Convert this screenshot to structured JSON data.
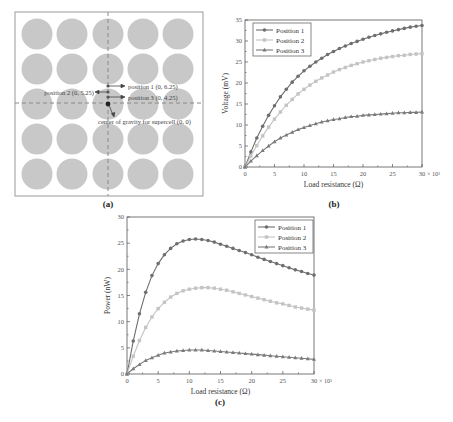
{
  "panel_a": {
    "caption": "(a)",
    "grid_rows": 5,
    "grid_cols": 5,
    "annotations": {
      "position1": "position 1 (0, 6.25)",
      "position2": "position 2 (0, 5.25)",
      "position3": "position 3 (0, 4.25)",
      "center": "center of gravity for supercell (0, 0)"
    },
    "colors": {
      "circle": "#c8c8c8",
      "dashed_line": "#888888",
      "frame": "#999999"
    }
  },
  "chart_data": [
    {
      "id": "b",
      "type": "line",
      "caption": "(b)",
      "title": "",
      "xlabel": "Load resistance (Ω)",
      "ylabel": "Voltage (mV)",
      "x_multiplier": "× 10³",
      "xlim": [
        0,
        30
      ],
      "ylim": [
        0,
        35
      ],
      "xticks": [
        0,
        5,
        10,
        15,
        20,
        25,
        30
      ],
      "yticks": [
        0,
        5,
        10,
        15,
        20,
        25,
        30,
        35
      ],
      "grid": false,
      "legend_position": "top-left",
      "x": [
        0,
        1,
        2,
        3,
        4,
        5,
        6,
        7,
        8,
        9,
        10,
        11,
        12,
        13,
        14,
        15,
        16,
        17,
        18,
        19,
        20,
        21,
        22,
        23,
        24,
        25,
        26,
        27,
        28,
        29,
        30
      ],
      "series": [
        {
          "name": "Position 1",
          "marker": "circle",
          "color": "#6e6e6e",
          "values": [
            0,
            3.6,
            6.9,
            9.7,
            12.3,
            14.6,
            16.7,
            18.5,
            20.2,
            21.6,
            22.9,
            24.0,
            25.0,
            25.9,
            26.8,
            27.5,
            28.2,
            28.8,
            29.4,
            29.9,
            30.4,
            30.9,
            31.3,
            31.7,
            32.1,
            32.4,
            32.7,
            33.0,
            33.3,
            33.5,
            33.7
          ]
        },
        {
          "name": "Position 2",
          "marker": "square",
          "color": "#c4c4c4",
          "values": [
            0,
            2.6,
            5.1,
            7.4,
            9.5,
            11.4,
            13.1,
            14.7,
            16.1,
            17.4,
            18.5,
            19.5,
            20.4,
            21.2,
            21.9,
            22.6,
            23.2,
            23.7,
            24.2,
            24.6,
            25.0,
            25.3,
            25.6,
            25.9,
            26.1,
            26.3,
            26.5,
            26.6,
            26.8,
            26.9,
            27.0
          ]
        },
        {
          "name": "Position 3",
          "marker": "triangle",
          "color": "#7a7a7a",
          "values": [
            0,
            1.4,
            2.7,
            3.9,
            5.0,
            6.0,
            6.9,
            7.6,
            8.3,
            8.9,
            9.4,
            9.9,
            10.3,
            10.7,
            11.0,
            11.3,
            11.5,
            11.8,
            12.0,
            12.1,
            12.3,
            12.4,
            12.5,
            12.6,
            12.7,
            12.8,
            12.9,
            12.9,
            13.0,
            13.0,
            13.1
          ]
        }
      ]
    },
    {
      "id": "c",
      "type": "line",
      "caption": "(c)",
      "title": "",
      "xlabel": "Load resistance (Ω)",
      "ylabel": "Power (nW)",
      "x_multiplier": "× 10³",
      "xlim": [
        0,
        30
      ],
      "ylim": [
        0,
        30
      ],
      "xticks": [
        0,
        5,
        10,
        15,
        20,
        25,
        30
      ],
      "yticks": [
        0,
        5,
        10,
        15,
        20,
        25,
        30
      ],
      "grid": false,
      "legend_position": "top-right",
      "x": [
        0,
        1,
        2,
        3,
        4,
        5,
        6,
        7,
        8,
        9,
        10,
        11,
        12,
        13,
        14,
        15,
        16,
        17,
        18,
        19,
        20,
        21,
        22,
        23,
        24,
        25,
        26,
        27,
        28,
        29,
        30
      ],
      "series": [
        {
          "name": "Position 1",
          "marker": "circle",
          "color": "#6e6e6e",
          "values": [
            0,
            6.3,
            11.5,
            15.6,
            18.8,
            21.1,
            22.8,
            24.0,
            24.9,
            25.4,
            25.7,
            25.8,
            25.7,
            25.5,
            25.2,
            24.8,
            24.4,
            24.0,
            23.6,
            23.2,
            22.8,
            22.3,
            21.9,
            21.5,
            21.1,
            20.7,
            20.3,
            19.9,
            19.6,
            19.2,
            18.9
          ]
        },
        {
          "name": "Position 2",
          "marker": "square",
          "color": "#c4c4c4",
          "values": [
            0,
            3.4,
            6.4,
            8.9,
            10.9,
            12.5,
            13.7,
            14.7,
            15.4,
            15.9,
            16.2,
            16.4,
            16.5,
            16.5,
            16.4,
            16.2,
            16.0,
            15.7,
            15.4,
            15.1,
            14.8,
            14.5,
            14.2,
            13.9,
            13.6,
            13.4,
            13.1,
            12.8,
            12.6,
            12.4,
            12.2
          ]
        },
        {
          "name": "Position 3",
          "marker": "triangle",
          "color": "#7a7a7a",
          "values": [
            0,
            1.0,
            1.8,
            2.6,
            3.1,
            3.6,
            4.0,
            4.2,
            4.4,
            4.5,
            4.6,
            4.6,
            4.6,
            4.5,
            4.4,
            4.3,
            4.2,
            4.1,
            4.0,
            3.9,
            3.8,
            3.7,
            3.6,
            3.5,
            3.4,
            3.3,
            3.2,
            3.1,
            3.0,
            2.9,
            2.8
          ]
        }
      ]
    }
  ]
}
